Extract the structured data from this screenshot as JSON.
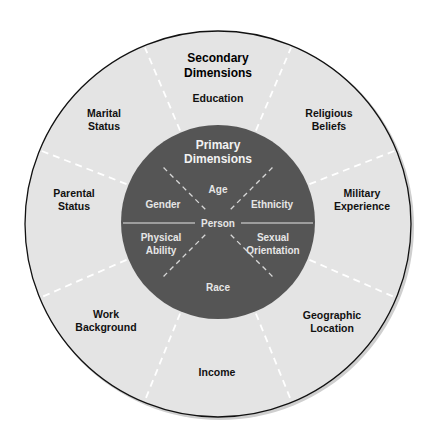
{
  "diagram": {
    "secondary_title": [
      "Secondary",
      "Dimensions"
    ],
    "primary_title": [
      "Primary",
      "Dimensions"
    ],
    "center_label": "Person",
    "secondary_dimensions": [
      {
        "lines": [
          "Education"
        ]
      },
      {
        "lines": [
          "Religious",
          "Beliefs"
        ]
      },
      {
        "lines": [
          "Military",
          "Experience"
        ]
      },
      {
        "lines": [
          "Geographic",
          "Location"
        ]
      },
      {
        "lines": [
          "Income"
        ]
      },
      {
        "lines": [
          "Work",
          "Background"
        ]
      },
      {
        "lines": [
          "Parental",
          "Status"
        ]
      },
      {
        "lines": [
          "Marital",
          "Status"
        ]
      }
    ],
    "primary_dimensions": [
      {
        "lines": [
          "Age"
        ]
      },
      {
        "lines": [
          "Ethnicity"
        ]
      },
      {
        "lines": [
          "Sexual",
          "Orientation"
        ]
      },
      {
        "lines": [
          "Race"
        ]
      },
      {
        "lines": [
          "Physical",
          "Ability"
        ]
      },
      {
        "lines": [
          "Gender"
        ]
      }
    ],
    "colors": {
      "outer_ring": "#e4e4e4",
      "inner_circle": "#555555",
      "outline": "#111111",
      "divider": "#ffffff"
    }
  }
}
